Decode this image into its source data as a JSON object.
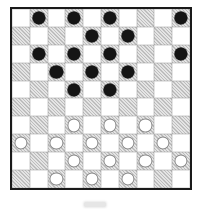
{
  "page": {
    "background": "#ffffff"
  },
  "board": {
    "type": "draughts-board-10x10",
    "rows": 10,
    "cols": 10,
    "dark_square_rule": "row plus col odd",
    "colors": {
      "border": "#1a1a1a",
      "light_square": "#ffffff",
      "dark_square_hatch_line": "#bdbdbd",
      "dark_square_hatch_base": "#e4e4e4",
      "grid_line": "#9a9a9a",
      "black_piece": "#151515",
      "white_piece_fill": "#ffffff",
      "white_piece_outline": "#8a8a8a"
    },
    "pieces": {
      "black": [
        [
          1,
          2
        ],
        [
          1,
          4
        ],
        [
          1,
          6
        ],
        [
          1,
          10
        ],
        [
          2,
          5
        ],
        [
          2,
          7
        ],
        [
          3,
          2
        ],
        [
          3,
          4
        ],
        [
          3,
          6
        ],
        [
          3,
          10
        ],
        [
          4,
          3
        ],
        [
          4,
          5
        ],
        [
          4,
          7
        ],
        [
          5,
          4
        ],
        [
          5,
          6
        ]
      ],
      "white": [
        [
          7,
          4
        ],
        [
          7,
          6
        ],
        [
          7,
          8
        ],
        [
          8,
          1
        ],
        [
          8,
          3
        ],
        [
          8,
          5
        ],
        [
          8,
          7
        ],
        [
          8,
          9
        ],
        [
          9,
          4
        ],
        [
          9,
          6
        ],
        [
          9,
          8
        ],
        [
          9,
          10
        ],
        [
          10,
          3
        ],
        [
          10,
          5
        ],
        [
          10,
          7
        ]
      ]
    },
    "counts": {
      "black": 15,
      "white": 15
    }
  },
  "artifact": {
    "note": "faint gray print smudge below board"
  }
}
